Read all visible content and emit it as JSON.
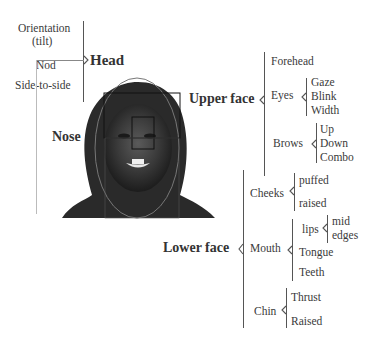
{
  "head": {
    "label": "Head",
    "items": [
      "Orientation",
      "(tilt)",
      "Nod",
      "Side-to-side"
    ]
  },
  "nose": {
    "label": "Nose"
  },
  "upper_face": {
    "label": "Upper face",
    "forehead": "Forehead",
    "eyes": {
      "label": "Eyes",
      "items": [
        "Gaze",
        "Blink",
        "Width"
      ]
    },
    "brows": {
      "label": "Brows",
      "items": [
        "Up",
        "Down",
        "Combo"
      ]
    }
  },
  "lower_face": {
    "label": "Lower face",
    "cheeks": {
      "label": "Cheeks",
      "items": [
        "puffed",
        "raised"
      ]
    },
    "mouth": {
      "label": "Mouth",
      "lips": {
        "label": "lips",
        "items": [
          "mid",
          "edges"
        ]
      },
      "items": [
        "Tongue",
        "Teeth"
      ]
    },
    "chin": {
      "label": "Chin",
      "items": [
        "Thrust",
        "Raised"
      ]
    }
  },
  "photo": {
    "description": "face-photo-with-region-boxes"
  }
}
